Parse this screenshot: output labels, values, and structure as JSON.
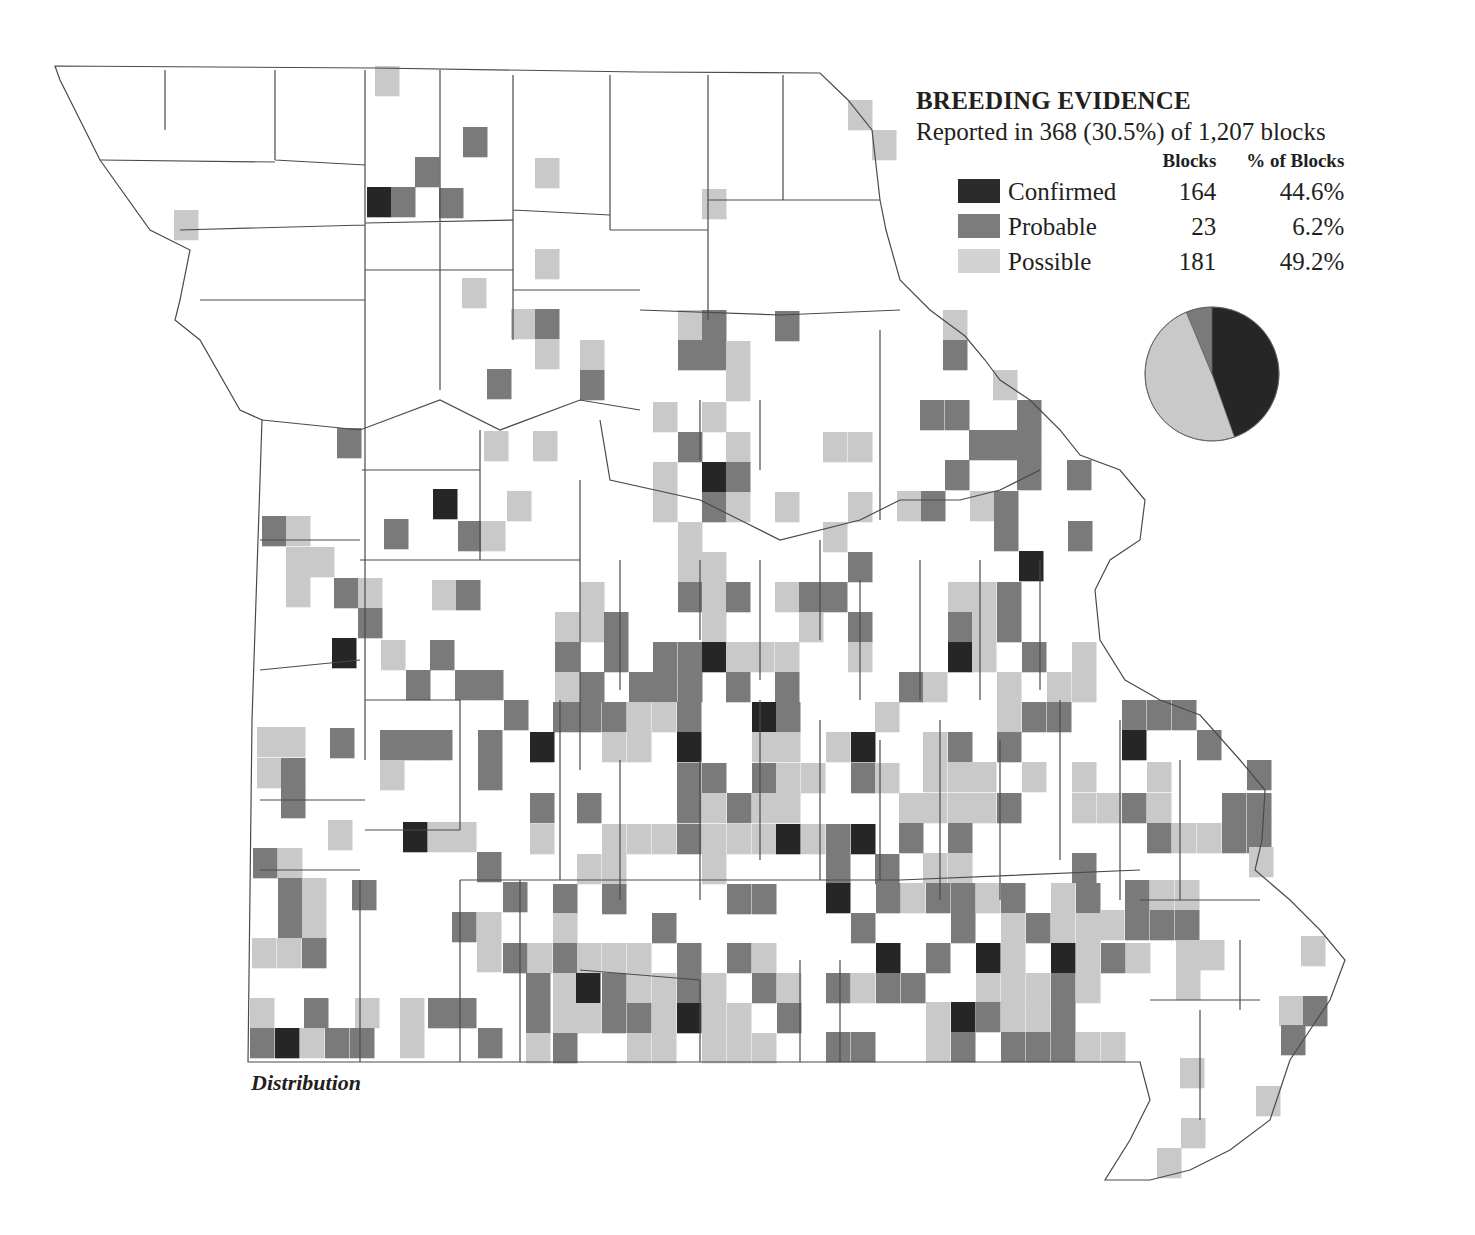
{
  "legend": {
    "title": "BREEDING EVIDENCE",
    "subtitle": "Reported in 368 (30.5%) of 1,207 blocks",
    "col_blocks": "Blocks",
    "col_pct": "% of Blocks",
    "rows": [
      {
        "label": "Confirmed",
        "blocks": "164",
        "pct": "44.6%",
        "color": "#2b2b2b"
      },
      {
        "label": "Probable",
        "blocks": "23",
        "pct": "6.2%",
        "color": "#7c7c7c"
      },
      {
        "label": "Possible",
        "blocks": "181",
        "pct": "49.2%",
        "color": "#d3d3d3"
      }
    ]
  },
  "map_label": "Distribution",
  "colors": {
    "D": "#262626",
    "M": "#7a7a7a",
    "L": "#c9c9c9",
    "outline": "#4a4a4a"
  },
  "chart_data": {
    "type": "pie",
    "title": "BREEDING EVIDENCE",
    "subtitle": "Reported in 368 (30.5%) of 1,207 blocks",
    "categories": [
      "Confirmed",
      "Probable",
      "Possible"
    ],
    "values": [
      164,
      23,
      181
    ],
    "percent": [
      44.6,
      6.2,
      49.2
    ],
    "colors": [
      "#262626",
      "#7a7a7a",
      "#c9c9c9"
    ]
  },
  "blocks": [
    [
      375,
      66,
      "L"
    ],
    [
      848,
      100,
      "L"
    ],
    [
      872,
      130,
      "L"
    ],
    [
      463,
      127,
      "M"
    ],
    [
      535,
      158,
      "L"
    ],
    [
      415,
      157,
      "M"
    ],
    [
      367,
      187,
      "D"
    ],
    [
      391,
      187,
      "M"
    ],
    [
      439,
      188,
      "M"
    ],
    [
      702,
      189,
      "L"
    ],
    [
      174,
      210,
      "L"
    ],
    [
      535,
      249,
      "L"
    ],
    [
      462,
      278,
      "L"
    ],
    [
      511,
      309,
      "L"
    ],
    [
      535,
      309,
      "M"
    ],
    [
      535,
      339,
      "L"
    ],
    [
      487,
      369,
      "M"
    ],
    [
      580,
      340,
      "L"
    ],
    [
      580,
      370,
      "M"
    ],
    [
      678,
      310,
      "L"
    ],
    [
      702,
      310,
      "M"
    ],
    [
      678,
      340,
      "M"
    ],
    [
      702,
      340,
      "M"
    ],
    [
      726,
      341,
      "L"
    ],
    [
      726,
      371,
      "L"
    ],
    [
      775,
      311,
      "M"
    ],
    [
      943,
      310,
      "L"
    ],
    [
      943,
      340,
      "M"
    ],
    [
      993,
      370,
      "L"
    ],
    [
      920,
      400,
      "M"
    ],
    [
      945,
      400,
      "M"
    ],
    [
      1017,
      400,
      "M"
    ],
    [
      969,
      430,
      "M"
    ],
    [
      993,
      430,
      "M"
    ],
    [
      1017,
      430,
      "M"
    ],
    [
      945,
      460,
      "M"
    ],
    [
      1017,
      460,
      "M"
    ],
    [
      1067,
      460,
      "M"
    ],
    [
      897,
      491,
      "L"
    ],
    [
      921,
      491,
      "M"
    ],
    [
      970,
      491,
      "L"
    ],
    [
      994,
      491,
      "M"
    ],
    [
      994,
      521,
      "M"
    ],
    [
      1068,
      521,
      "M"
    ],
    [
      1019,
      551,
      "D"
    ],
    [
      337,
      428,
      "M"
    ],
    [
      484,
      431,
      "L"
    ],
    [
      533,
      431,
      "L"
    ],
    [
      653,
      402,
      "L"
    ],
    [
      702,
      402,
      "L"
    ],
    [
      678,
      432,
      "M"
    ],
    [
      726,
      432,
      "L"
    ],
    [
      823,
      432,
      "L"
    ],
    [
      848,
      432,
      "L"
    ],
    [
      433,
      489,
      "D"
    ],
    [
      507,
      491,
      "L"
    ],
    [
      384,
      519,
      "M"
    ],
    [
      458,
      521,
      "M"
    ],
    [
      481,
      521,
      "L"
    ],
    [
      653,
      462,
      "L"
    ],
    [
      702,
      462,
      "D"
    ],
    [
      726,
      462,
      "M"
    ],
    [
      653,
      492,
      "L"
    ],
    [
      702,
      492,
      "M"
    ],
    [
      726,
      492,
      "L"
    ],
    [
      775,
      492,
      "L"
    ],
    [
      848,
      492,
      "L"
    ],
    [
      262,
      516,
      "M"
    ],
    [
      286,
      516,
      "L"
    ],
    [
      286,
      547,
      "L"
    ],
    [
      310,
      547,
      "L"
    ],
    [
      286,
      577,
      "L"
    ],
    [
      678,
      522,
      "L"
    ],
    [
      823,
      522,
      "L"
    ],
    [
      678,
      552,
      "L"
    ],
    [
      702,
      552,
      "L"
    ],
    [
      848,
      552,
      "M"
    ],
    [
      334,
      578,
      "M"
    ],
    [
      358,
      578,
      "L"
    ],
    [
      358,
      608,
      "M"
    ],
    [
      432,
      580,
      "L"
    ],
    [
      456,
      580,
      "M"
    ],
    [
      580,
      582,
      "L"
    ],
    [
      678,
      582,
      "M"
    ],
    [
      702,
      582,
      "L"
    ],
    [
      726,
      582,
      "M"
    ],
    [
      775,
      582,
      "L"
    ],
    [
      799,
      582,
      "M"
    ],
    [
      823,
      582,
      "M"
    ],
    [
      948,
      582,
      "L"
    ],
    [
      972,
      582,
      "L"
    ],
    [
      997,
      582,
      "M"
    ],
    [
      555,
      612,
      "L"
    ],
    [
      580,
      612,
      "L"
    ],
    [
      604,
      612,
      "M"
    ],
    [
      702,
      612,
      "L"
    ],
    [
      799,
      612,
      "L"
    ],
    [
      848,
      612,
      "M"
    ],
    [
      948,
      612,
      "M"
    ],
    [
      972,
      612,
      "L"
    ],
    [
      997,
      612,
      "M"
    ],
    [
      332,
      638,
      "D"
    ],
    [
      381,
      640,
      "L"
    ],
    [
      430,
      640,
      "M"
    ],
    [
      555,
      642,
      "M"
    ],
    [
      604,
      642,
      "M"
    ],
    [
      653,
      642,
      "M"
    ],
    [
      678,
      642,
      "M"
    ],
    [
      702,
      642,
      "D"
    ],
    [
      726,
      642,
      "L"
    ],
    [
      750,
      642,
      "L"
    ],
    [
      775,
      642,
      "L"
    ],
    [
      848,
      642,
      "L"
    ],
    [
      948,
      642,
      "D"
    ],
    [
      972,
      642,
      "L"
    ],
    [
      1022,
      642,
      "M"
    ],
    [
      1072,
      642,
      "L"
    ],
    [
      406,
      670,
      "M"
    ],
    [
      455,
      670,
      "M"
    ],
    [
      479,
      670,
      "M"
    ],
    [
      555,
      672,
      "L"
    ],
    [
      580,
      672,
      "M"
    ],
    [
      629,
      672,
      "M"
    ],
    [
      653,
      672,
      "M"
    ],
    [
      678,
      672,
      "M"
    ],
    [
      726,
      672,
      "M"
    ],
    [
      775,
      672,
      "M"
    ],
    [
      899,
      672,
      "M"
    ],
    [
      923,
      672,
      "L"
    ],
    [
      997,
      672,
      "L"
    ],
    [
      1047,
      672,
      "L"
    ],
    [
      1072,
      672,
      "L"
    ],
    [
      504,
      700,
      "M"
    ],
    [
      553,
      702,
      "M"
    ],
    [
      577,
      702,
      "M"
    ],
    [
      602,
      702,
      "M"
    ],
    [
      627,
      702,
      "L"
    ],
    [
      652,
      702,
      "L"
    ],
    [
      677,
      702,
      "M"
    ],
    [
      752,
      702,
      "D"
    ],
    [
      776,
      702,
      "M"
    ],
    [
      875,
      702,
      "L"
    ],
    [
      997,
      702,
      "L"
    ],
    [
      1022,
      702,
      "M"
    ],
    [
      1047,
      702,
      "M"
    ],
    [
      1122,
      700,
      "M"
    ],
    [
      1147,
      700,
      "M"
    ],
    [
      1172,
      700,
      "M"
    ],
    [
      257,
      727,
      "L"
    ],
    [
      281,
      727,
      "L"
    ],
    [
      330,
      728,
      "M"
    ],
    [
      380,
      730,
      "M"
    ],
    [
      404,
      730,
      "M"
    ],
    [
      428,
      730,
      "M"
    ],
    [
      478,
      730,
      "M"
    ],
    [
      530,
      732,
      "D"
    ],
    [
      602,
      732,
      "L"
    ],
    [
      627,
      732,
      "L"
    ],
    [
      677,
      732,
      "D"
    ],
    [
      752,
      732,
      "L"
    ],
    [
      776,
      732,
      "L"
    ],
    [
      826,
      732,
      "L"
    ],
    [
      851,
      732,
      "D"
    ],
    [
      923,
      732,
      "L"
    ],
    [
      948,
      732,
      "M"
    ],
    [
      997,
      732,
      "M"
    ],
    [
      1122,
      730,
      "D"
    ],
    [
      1197,
      730,
      "M"
    ],
    [
      257,
      758,
      "L"
    ],
    [
      281,
      758,
      "M"
    ],
    [
      380,
      760,
      "L"
    ],
    [
      478,
      760,
      "M"
    ],
    [
      677,
      763,
      "M"
    ],
    [
      702,
      763,
      "M"
    ],
    [
      752,
      763,
      "M"
    ],
    [
      776,
      763,
      "L"
    ],
    [
      801,
      763,
      "L"
    ],
    [
      851,
      763,
      "M"
    ],
    [
      875,
      763,
      "L"
    ],
    [
      923,
      762,
      "L"
    ],
    [
      948,
      762,
      "L"
    ],
    [
      972,
      762,
      "L"
    ],
    [
      1022,
      762,
      "L"
    ],
    [
      1072,
      762,
      "L"
    ],
    [
      1147,
      762,
      "L"
    ],
    [
      1247,
      760,
      "M"
    ],
    [
      281,
      788,
      "M"
    ],
    [
      530,
      793,
      "M"
    ],
    [
      577,
      793,
      "M"
    ],
    [
      677,
      793,
      "M"
    ],
    [
      702,
      793,
      "L"
    ],
    [
      727,
      793,
      "M"
    ],
    [
      752,
      793,
      "L"
    ],
    [
      776,
      793,
      "L"
    ],
    [
      899,
      793,
      "L"
    ],
    [
      923,
      793,
      "L"
    ],
    [
      948,
      793,
      "L"
    ],
    [
      972,
      793,
      "L"
    ],
    [
      997,
      793,
      "M"
    ],
    [
      1072,
      793,
      "L"
    ],
    [
      1097,
      793,
      "L"
    ],
    [
      1122,
      793,
      "M"
    ],
    [
      1147,
      793,
      "L"
    ],
    [
      1222,
      793,
      "M"
    ],
    [
      1247,
      793,
      "M"
    ],
    [
      328,
      820,
      "L"
    ],
    [
      403,
      822,
      "D"
    ],
    [
      428,
      822,
      "L"
    ],
    [
      452,
      822,
      "L"
    ],
    [
      530,
      824,
      "L"
    ],
    [
      602,
      824,
      "L"
    ],
    [
      627,
      824,
      "L"
    ],
    [
      652,
      824,
      "L"
    ],
    [
      677,
      824,
      "M"
    ],
    [
      702,
      824,
      "L"
    ],
    [
      727,
      824,
      "L"
    ],
    [
      752,
      824,
      "L"
    ],
    [
      776,
      824,
      "D"
    ],
    [
      801,
      824,
      "L"
    ],
    [
      826,
      824,
      "M"
    ],
    [
      851,
      824,
      "D"
    ],
    [
      899,
      823,
      "M"
    ],
    [
      948,
      823,
      "M"
    ],
    [
      1147,
      823,
      "M"
    ],
    [
      1172,
      823,
      "L"
    ],
    [
      1197,
      823,
      "L"
    ],
    [
      1222,
      823,
      "M"
    ],
    [
      1247,
      823,
      "M"
    ],
    [
      253,
      848,
      "M"
    ],
    [
      278,
      848,
      "L"
    ],
    [
      477,
      852,
      "M"
    ],
    [
      577,
      854,
      "L"
    ],
    [
      602,
      854,
      "L"
    ],
    [
      702,
      854,
      "L"
    ],
    [
      826,
      854,
      "M"
    ],
    [
      875,
      854,
      "M"
    ],
    [
      923,
      853,
      "L"
    ],
    [
      948,
      853,
      "L"
    ],
    [
      1072,
      853,
      "M"
    ],
    [
      1249,
      847,
      "L"
    ],
    [
      278,
      878,
      "M"
    ],
    [
      302,
      878,
      "L"
    ],
    [
      352,
      880,
      "M"
    ],
    [
      503,
      882,
      "M"
    ],
    [
      553,
      884,
      "M"
    ],
    [
      602,
      884,
      "M"
    ],
    [
      727,
      884,
      "M"
    ],
    [
      752,
      884,
      "M"
    ],
    [
      826,
      883,
      "D"
    ],
    [
      876,
      883,
      "M"
    ],
    [
      901,
      883,
      "L"
    ],
    [
      926,
      883,
      "M"
    ],
    [
      951,
      883,
      "M"
    ],
    [
      976,
      883,
      "L"
    ],
    [
      1001,
      883,
      "M"
    ],
    [
      1051,
      883,
      "L"
    ],
    [
      1076,
      883,
      "M"
    ],
    [
      1125,
      880,
      "M"
    ],
    [
      1150,
      880,
      "L"
    ],
    [
      1175,
      880,
      "L"
    ],
    [
      278,
      908,
      "M"
    ],
    [
      302,
      908,
      "L"
    ],
    [
      452,
      912,
      "M"
    ],
    [
      477,
      912,
      "L"
    ],
    [
      553,
      913,
      "L"
    ],
    [
      652,
      913,
      "M"
    ],
    [
      851,
      913,
      "M"
    ],
    [
      951,
      913,
      "M"
    ],
    [
      1001,
      913,
      "L"
    ],
    [
      1026,
      913,
      "M"
    ],
    [
      1051,
      913,
      "L"
    ],
    [
      1076,
      913,
      "L"
    ],
    [
      1100,
      910,
      "L"
    ],
    [
      1125,
      910,
      "M"
    ],
    [
      1150,
      910,
      "M"
    ],
    [
      1175,
      910,
      "M"
    ],
    [
      252,
      938,
      "L"
    ],
    [
      277,
      938,
      "L"
    ],
    [
      302,
      938,
      "M"
    ],
    [
      477,
      942,
      "L"
    ],
    [
      503,
      943,
      "M"
    ],
    [
      528,
      943,
      "L"
    ],
    [
      553,
      943,
      "M"
    ],
    [
      577,
      943,
      "L"
    ],
    [
      602,
      943,
      "L"
    ],
    [
      627,
      943,
      "L"
    ],
    [
      677,
      943,
      "M"
    ],
    [
      727,
      943,
      "M"
    ],
    [
      752,
      943,
      "L"
    ],
    [
      876,
      943,
      "D"
    ],
    [
      926,
      943,
      "M"
    ],
    [
      976,
      943,
      "D"
    ],
    [
      1001,
      943,
      "L"
    ],
    [
      1051,
      943,
      "D"
    ],
    [
      1076,
      943,
      "L"
    ],
    [
      1101,
      943,
      "M"
    ],
    [
      1126,
      943,
      "L"
    ],
    [
      1176,
      940,
      "L"
    ],
    [
      1200,
      940,
      "L"
    ],
    [
      1301,
      936,
      "L"
    ],
    [
      526,
      973,
      "M"
    ],
    [
      553,
      973,
      "L"
    ],
    [
      576,
      973,
      "D"
    ],
    [
      602,
      973,
      "M"
    ],
    [
      627,
      973,
      "L"
    ],
    [
      652,
      973,
      "L"
    ],
    [
      677,
      973,
      "M"
    ],
    [
      702,
      973,
      "L"
    ],
    [
      752,
      973,
      "M"
    ],
    [
      777,
      973,
      "L"
    ],
    [
      826,
      973,
      "M"
    ],
    [
      851,
      973,
      "L"
    ],
    [
      876,
      973,
      "M"
    ],
    [
      901,
      973,
      "M"
    ],
    [
      976,
      973,
      "L"
    ],
    [
      1001,
      973,
      "L"
    ],
    [
      1026,
      973,
      "L"
    ],
    [
      1051,
      973,
      "M"
    ],
    [
      1076,
      973,
      "L"
    ],
    [
      1176,
      970,
      "L"
    ],
    [
      250,
      998,
      "L"
    ],
    [
      304,
      998,
      "M"
    ],
    [
      355,
      998,
      "L"
    ],
    [
      400,
      998,
      "L"
    ],
    [
      428,
      998,
      "M"
    ],
    [
      452,
      998,
      "M"
    ],
    [
      526,
      1003,
      "M"
    ],
    [
      553,
      1003,
      "L"
    ],
    [
      577,
      1003,
      "L"
    ],
    [
      602,
      1003,
      "M"
    ],
    [
      627,
      1003,
      "M"
    ],
    [
      652,
      1003,
      "L"
    ],
    [
      677,
      1003,
      "D"
    ],
    [
      702,
      1003,
      "L"
    ],
    [
      727,
      1003,
      "L"
    ],
    [
      777,
      1003,
      "M"
    ],
    [
      926,
      1002,
      "L"
    ],
    [
      951,
      1002,
      "D"
    ],
    [
      976,
      1002,
      "M"
    ],
    [
      1001,
      1002,
      "L"
    ],
    [
      1026,
      1002,
      "L"
    ],
    [
      1051,
      1002,
      "M"
    ],
    [
      1279,
      996,
      "L"
    ],
    [
      1303,
      996,
      "M"
    ],
    [
      250,
      1028,
      "M"
    ],
    [
      275,
      1028,
      "D"
    ],
    [
      300,
      1028,
      "L"
    ],
    [
      325,
      1028,
      "M"
    ],
    [
      350,
      1028,
      "M"
    ],
    [
      400,
      1028,
      "L"
    ],
    [
      478,
      1028,
      "M"
    ],
    [
      526,
      1033,
      "L"
    ],
    [
      553,
      1033,
      "M"
    ],
    [
      627,
      1033,
      "L"
    ],
    [
      652,
      1033,
      "L"
    ],
    [
      702,
      1033,
      "L"
    ],
    [
      727,
      1033,
      "L"
    ],
    [
      752,
      1033,
      "L"
    ],
    [
      826,
      1032,
      "M"
    ],
    [
      851,
      1032,
      "M"
    ],
    [
      926,
      1032,
      "L"
    ],
    [
      951,
      1032,
      "M"
    ],
    [
      1001,
      1032,
      "M"
    ],
    [
      1026,
      1032,
      "M"
    ],
    [
      1051,
      1032,
      "M"
    ],
    [
      1076,
      1032,
      "L"
    ],
    [
      1101,
      1032,
      "L"
    ],
    [
      1281,
      1025,
      "M"
    ],
    [
      1180,
      1058,
      "L"
    ],
    [
      1256,
      1086,
      "L"
    ],
    [
      1181,
      1118,
      "L"
    ],
    [
      1157,
      1148,
      "L"
    ]
  ]
}
